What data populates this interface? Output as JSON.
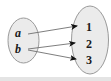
{
  "diagram": {
    "type": "mapping-diagram",
    "background_color": "#ffffff",
    "sets": [
      {
        "id": "domain",
        "role": "domain-set",
        "shape": "ellipse",
        "fill_color": "#ebebeb",
        "stroke_color": "#9a9a9a",
        "cx": 23.5,
        "cy": 40.5,
        "rx": 15.5,
        "ry": 22.5,
        "elements": [
          {
            "id": "a",
            "label": "a",
            "style": "italic",
            "x": 18,
            "y": 37
          },
          {
            "id": "b",
            "label": "b",
            "style": "italic",
            "x": 18,
            "y": 53
          }
        ]
      },
      {
        "id": "codomain",
        "role": "codomain-set",
        "shape": "ellipse",
        "fill_color": "#ebebeb",
        "stroke_color": "#9a9a9a",
        "cx": 90,
        "cy": 40,
        "rx": 18.5,
        "ry": 34,
        "elements": [
          {
            "id": "1",
            "label": "1",
            "style": "upright",
            "x": 89,
            "y": 31
          },
          {
            "id": "2",
            "label": "2",
            "style": "upright",
            "x": 89,
            "y": 48
          },
          {
            "id": "3",
            "label": "3",
            "style": "upright",
            "x": 89,
            "y": 64
          }
        ]
      }
    ],
    "arrows": [
      {
        "id": "a-to-1",
        "from": "a",
        "to": "1",
        "x1": 28,
        "y1": 34,
        "x2": 77,
        "y2": 26,
        "stroke_color": "#6f6f6f"
      },
      {
        "id": "b-to-2",
        "from": "b",
        "to": "2",
        "x1": 28,
        "y1": 49,
        "x2": 75,
        "y2": 43,
        "stroke_color": "#6f6f6f"
      },
      {
        "id": "b-to-3",
        "from": "b",
        "to": "3",
        "x1": 28,
        "y1": 50,
        "x2": 76,
        "y2": 59,
        "stroke_color": "#6f6f6f"
      }
    ],
    "arrowhead": {
      "color": "#111111",
      "shape": "solid-triangle"
    },
    "footer_band": {
      "color": "#e4e4e4",
      "height": 4
    }
  }
}
